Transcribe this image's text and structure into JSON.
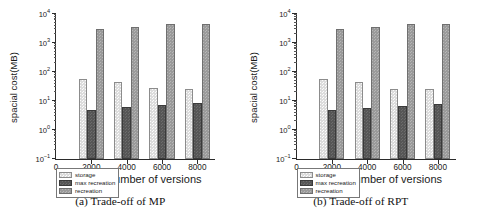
{
  "figure": {
    "panels": [
      {
        "caption": "(a) Trade-off of MP",
        "chart_data": {
          "type": "bar",
          "title": "(a) Trade-off of MP",
          "xlabel": "number of versions",
          "ylabel": "spacial cost(MB)",
          "yscale": "log",
          "ylim": [
            0.1,
            10000
          ],
          "ytick_labels": [
            "10-1",
            "100",
            "101",
            "102",
            "103",
            "104"
          ],
          "ytick_values": [
            0.1,
            1,
            10,
            100,
            1000,
            10000
          ],
          "xtick_labels": [
            "0",
            "2000",
            "4000",
            "6000",
            "8000"
          ],
          "xlim": [
            0,
            9000
          ],
          "grid": false,
          "legend_position": "below-left",
          "categories": [
            "2000",
            "4000",
            "6000",
            "8000"
          ],
          "series": [
            {
              "name": "storage",
              "color": "#dcdcdc",
              "values": [
                57,
                46,
                28,
                26
              ]
            },
            {
              "name": "max recreation",
              "color": "#565656",
              "values": [
                5.0,
                6.0,
                7.2,
                8.8
              ]
            },
            {
              "name": "recreation",
              "color": "#9a9a9a",
              "values": [
                3100,
                3500,
                4400,
                4700
              ]
            }
          ]
        },
        "axis": {
          "y_title": "spacial cost(MB)",
          "x_title": "number of versions",
          "x_origin": "0"
        },
        "legend": {
          "items": [
            {
              "label": "storage"
            },
            {
              "label": "max recreation"
            },
            {
              "label": "recreation"
            }
          ]
        }
      },
      {
        "caption": "(b) Trade-off of RPT",
        "chart_data": {
          "type": "bar",
          "title": "(b) Trade-off of RPT",
          "xlabel": "number of versions",
          "ylabel": "spacial cost(MB)",
          "yscale": "log",
          "ylim": [
            0.1,
            10000
          ],
          "ytick_labels": [
            "10-1",
            "100",
            "101",
            "102",
            "103",
            "104"
          ],
          "ytick_values": [
            0.1,
            1,
            10,
            100,
            1000,
            10000
          ],
          "xtick_labels": [
            "0",
            "2000",
            "4000",
            "6000",
            "8000"
          ],
          "xlim": [
            0,
            9000
          ],
          "grid": false,
          "legend_position": "below-left",
          "categories": [
            "2000",
            "4000",
            "6000",
            "8000"
          ],
          "series": [
            {
              "name": "storage",
              "color": "#dcdcdc",
              "values": [
                56,
                45,
                27,
                25
              ]
            },
            {
              "name": "max recreation",
              "color": "#565656",
              "values": [
                4.8,
                5.8,
                6.9,
                7.8
              ]
            },
            {
              "name": "recreation",
              "color": "#9a9a9a",
              "values": [
                3050,
                3450,
                4400,
                4550
              ]
            }
          ]
        },
        "axis": {
          "y_title": "spacial cost(MB)",
          "x_title": "number of versions",
          "x_origin": "0"
        },
        "legend": {
          "items": [
            {
              "label": "storage"
            },
            {
              "label": "max recreation"
            },
            {
              "label": "recreation"
            }
          ]
        }
      }
    ]
  }
}
